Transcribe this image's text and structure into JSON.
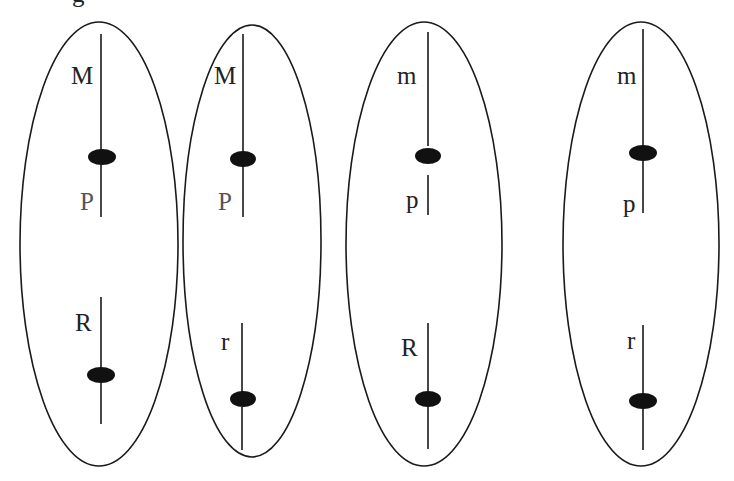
{
  "diagram": {
    "type": "chromosome-genotype-cells",
    "caption_fragment": "g",
    "cells": [
      {
        "id": "cell-1",
        "chromosome_1": {
          "upper_label": "M",
          "lower_label": "P"
        },
        "chromosome_2": {
          "label": "R"
        }
      },
      {
        "id": "cell-2",
        "chromosome_1": {
          "upper_label": "M",
          "lower_label": "P"
        },
        "chromosome_2": {
          "label": "r"
        }
      },
      {
        "id": "cell-3",
        "chromosome_1": {
          "upper_label": "m",
          "lower_label": "p"
        },
        "chromosome_2": {
          "label": "R"
        }
      },
      {
        "id": "cell-4",
        "chromosome_1": {
          "upper_label": "m",
          "lower_label": "p"
        },
        "chromosome_2": {
          "label": "r"
        }
      }
    ]
  }
}
